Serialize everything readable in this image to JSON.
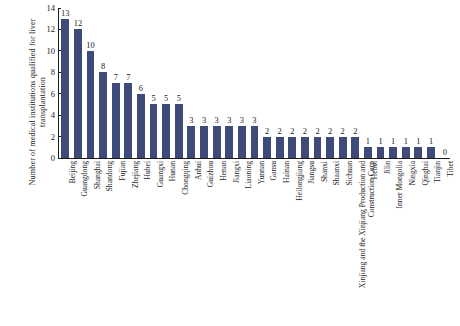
{
  "chart_data": {
    "type": "bar",
    "title": "",
    "xlabel": "",
    "ylabel": "Number of medical institutions qualified for liver transplantation",
    "ylim": [
      0,
      14
    ],
    "yticks": [
      0,
      2,
      4,
      6,
      8,
      10,
      12,
      14
    ],
    "grid": false,
    "legend": "none",
    "bar_color": "#3e4a79",
    "value_labels": true,
    "categories": [
      "Beijing",
      "Guangdong",
      "Shanghai",
      "Shandong",
      "Fujian",
      "Zhejiang",
      "Hubei",
      "Guangxi",
      "Hunan",
      "Chongqing",
      "Anhui",
      "Guizhou",
      "Henan",
      "Jiangxi",
      "Liaoning",
      "Yunnan",
      "Gansu",
      "Hainan",
      "Heilongjiang",
      "Jiangsu",
      "Shanxi",
      "Shaanxi",
      "Sichuan",
      "Xinjiang and the Xinjiang Production and Construction Corp",
      "Hebei",
      "Jilin",
      "Inner Mongolia",
      "Ningxia",
      "Qinghai",
      "Tianjin",
      "Tibet"
    ],
    "values": [
      13,
      12,
      10,
      8,
      7,
      7,
      6,
      5,
      5,
      5,
      3,
      3,
      3,
      3,
      3,
      3,
      2,
      2,
      2,
      2,
      2,
      2,
      2,
      2,
      1,
      1,
      1,
      1,
      1,
      1,
      0
    ]
  }
}
